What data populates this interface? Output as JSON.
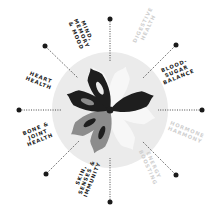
{
  "diagram": {
    "type": "radial-wheel",
    "center": [
      110,
      110
    ],
    "colors": {
      "background": "#ffffff",
      "disc": "#ebebeb",
      "petal_dark": "#1e1e1e",
      "petal_gray": "#8c8c8c",
      "petal_light": "#f7f7f7",
      "active_text": "#1a1a1a",
      "muted_text": "#cfcfcf",
      "connector": "#333333"
    },
    "segments": [
      {
        "id": "digestive-health",
        "label": "DIGESTIVE\nHEALTH",
        "state": "muted"
      },
      {
        "id": "blood-sugar-balance",
        "label": "BLOOD-\nSUGAR\nBALANCE",
        "state": "active"
      },
      {
        "id": "hormone-harmony",
        "label": "HORMONE\nHARMONY",
        "state": "muted"
      },
      {
        "id": "energy-boosting",
        "label": "ENERGY\nBOOSTING",
        "state": "muted"
      },
      {
        "id": "skin-senses-immunity",
        "label": "SKIN,\nSENSES &\nIMMUNITY",
        "state": "active"
      },
      {
        "id": "bone-joint-health",
        "label": "BONE &\nJOINT\nHEALTH",
        "state": "active"
      },
      {
        "id": "heart-health",
        "label": "HEART\nHEALTH",
        "state": "active"
      },
      {
        "id": "mind-memory-mood",
        "label": "MIND,\nMEMORY\n& MOOD",
        "state": "active"
      }
    ]
  }
}
